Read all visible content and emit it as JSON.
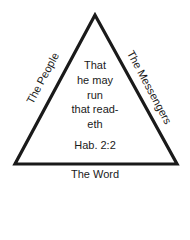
{
  "diagram": {
    "type": "triangle",
    "sides": {
      "left": "The People",
      "right": "The Messengers",
      "bottom": "The Word"
    },
    "center_lines": [
      "That",
      "he may",
      "run",
      "that read-",
      "eth"
    ],
    "reference": "Hab. 2:2",
    "colors": {
      "stroke": "#1a1a1a",
      "background": "#ffffff"
    }
  }
}
